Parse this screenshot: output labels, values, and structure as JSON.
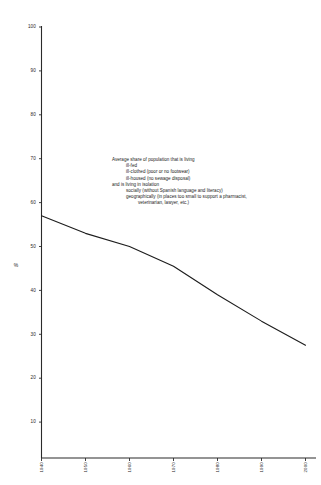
{
  "chart_data": {
    "type": "line",
    "title": "",
    "subtitle": "",
    "xlabel": "",
    "ylabel": "%",
    "x": [
      "1940",
      "1950",
      "1960",
      "1970",
      "1980",
      "1990",
      "2000"
    ],
    "categories": [
      "1940",
      "1950",
      "1960",
      "1970",
      "1980",
      "1990",
      "2000"
    ],
    "values": [
      57,
      53,
      50,
      45.5,
      39,
      33,
      27.5
    ],
    "series": [
      {
        "name": "Average share of population living in poverty and isolation",
        "values": [
          57,
          53,
          50,
          45.5,
          39,
          33,
          27.5
        ]
      }
    ],
    "ylim": [
      0,
      100
    ],
    "yticks": [
      10,
      20,
      30,
      40,
      50,
      60,
      70,
      80,
      90,
      100
    ],
    "ytick_labels": [
      "10",
      "20",
      "30",
      "40",
      "50",
      "60",
      "70",
      "80",
      "90",
      "100"
    ],
    "xtick_labels": [
      "1940",
      "1950",
      "1960",
      "1970",
      "1980",
      "1990",
      "2000"
    ],
    "grid": false,
    "legend": "none",
    "line_color": "#1d1d1d",
    "axis_color": "#2b2b2b",
    "background": "#ffffff"
  },
  "annotation": {
    "lines": [
      {
        "text": "Average share of population that is living",
        "indent": 0
      },
      {
        "text": "ill-fed",
        "indent": 1
      },
      {
        "text": "ill-clothed (poor or no footwear)",
        "indent": 1
      },
      {
        "text": "ill-housed (no sewage disposal)",
        "indent": 1
      },
      {
        "text": "and is living in isolation",
        "indent": 0
      },
      {
        "text": "socially (without Spanish language and literacy)",
        "indent": 1
      },
      {
        "text": "geographically (in places too small to support a pharmacist,",
        "indent": 1
      },
      {
        "text": "veterinarian, lawyer, etc.)",
        "indent": 2
      }
    ]
  }
}
